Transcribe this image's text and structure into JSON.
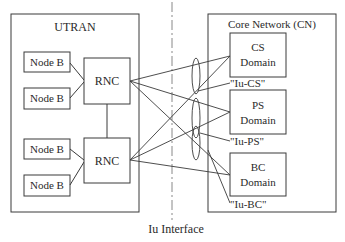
{
  "diagram": {
    "left_group": {
      "title": "UTRAN",
      "node_bs": [
        "Node B",
        "Node B",
        "Node B",
        "Node B"
      ],
      "rncs": [
        "RNC",
        "RNC"
      ]
    },
    "right_group": {
      "title": "Core Network (CN)",
      "domains": [
        {
          "line1": "CS",
          "line2": "Domain",
          "interface": "\"Iu-CS\""
        },
        {
          "line1": "PS",
          "line2": "Domain",
          "interface": "\"Iu-PS\""
        },
        {
          "line1": "BC",
          "line2": "Domain",
          "interface": "\"Iu-BC\""
        }
      ]
    },
    "divider_label": "Iu Interface",
    "colors": {
      "line": "#3a3a3a",
      "box_fill": "#ffffff",
      "dash": "#888888"
    }
  }
}
